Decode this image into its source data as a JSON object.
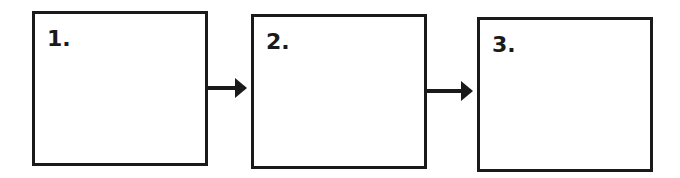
{
  "diagram": {
    "boxes": [
      {
        "label": "1."
      },
      {
        "label": "2."
      },
      {
        "label": "3."
      }
    ],
    "arrows": [
      {
        "from": "1.",
        "to": "2."
      },
      {
        "from": "2.",
        "to": "3."
      }
    ],
    "colors": {
      "stroke": "#1a1a1a",
      "background": "#ffffff"
    }
  }
}
